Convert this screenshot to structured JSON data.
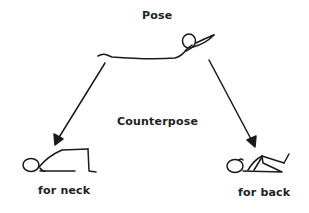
{
  "diagram": {
    "title": "Pose",
    "middle_label": "Counterpose",
    "counterposes": [
      {
        "label": "for neck"
      },
      {
        "label": "for back"
      }
    ],
    "colors": {
      "line": "#1a1a1a",
      "background": "#ffffff"
    }
  }
}
